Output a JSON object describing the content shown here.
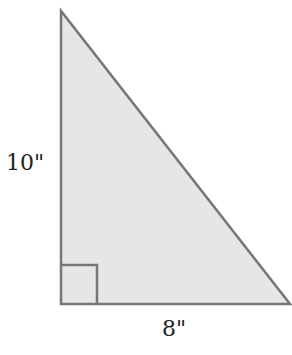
{
  "diagram": {
    "type": "right-triangle",
    "height_label": "10\"",
    "base_label": "8\"",
    "fill_color": "#e6e6e6",
    "stroke_color": "#777777"
  }
}
